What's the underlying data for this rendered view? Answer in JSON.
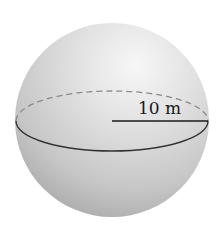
{
  "figure": {
    "shape": "sphere",
    "radius_label": "10 m",
    "colors": {
      "background": "#ffffff",
      "sphere_highlight": "#f4f4f4",
      "sphere_mid": "#d2d2d2",
      "sphere_shadow": "#a8a8a8",
      "equator_solid": "#333333",
      "equator_dashed": "#8a8a8a",
      "radius_line": "#1a1a1a",
      "text": "#1a1a1a"
    }
  }
}
